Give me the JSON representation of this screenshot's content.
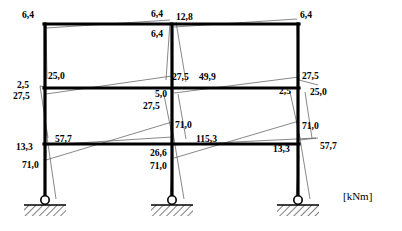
{
  "diagram": {
    "type": "bending-moment-diagram",
    "unit_label": "[kNm]",
    "structure": {
      "kind": "three-bay-three-storey-plane-frame",
      "columns": 3,
      "storeys": 3,
      "support_type": "pinned",
      "supports_count": 3
    },
    "labels": [
      {
        "id": "top-left-corner",
        "text": "6,4",
        "x": 22,
        "y": 10
      },
      {
        "id": "top-mid-above-left",
        "text": "6,4",
        "x": 151,
        "y": 9
      },
      {
        "id": "top-mid-right",
        "text": "12,8",
        "x": 176,
        "y": 12
      },
      {
        "id": "top-mid-below",
        "text": "6,4",
        "x": 151,
        "y": 29
      },
      {
        "id": "top-right-corner",
        "text": "6,4",
        "x": 300,
        "y": 10
      },
      {
        "id": "lvl2-left-outer-upper",
        "text": "2,5",
        "x": 17,
        "y": 80
      },
      {
        "id": "lvl2-left-outer-lower",
        "text": "27,5",
        "x": 13,
        "y": 91
      },
      {
        "id": "lvl2-left-inner",
        "text": "25,0",
        "x": 48,
        "y": 71
      },
      {
        "id": "lvl2-mid-upper-left",
        "text": "27,5",
        "x": 172,
        "y": 72
      },
      {
        "id": "lvl2-mid-upper-right",
        "text": "49,9",
        "x": 199,
        "y": 72
      },
      {
        "id": "lvl2-mid-below-upper",
        "text": "5,0",
        "x": 155,
        "y": 89
      },
      {
        "id": "lvl2-mid-below-lower",
        "text": "27,5",
        "x": 143,
        "y": 101
      },
      {
        "id": "lvl2-right-outer",
        "text": "27,5",
        "x": 302,
        "y": 71
      },
      {
        "id": "lvl2-right-inner-left",
        "text": "2,5",
        "x": 279,
        "y": 86
      },
      {
        "id": "lvl2-right-inner-right",
        "text": "25,0",
        "x": 310,
        "y": 87
      },
      {
        "id": "lvl3-mid-col-upper",
        "text": "71,0",
        "x": 175,
        "y": 120
      },
      {
        "id": "lvl3-right-col-upper",
        "text": "71,0",
        "x": 302,
        "y": 121
      },
      {
        "id": "lvl3-left-outer",
        "text": "13,3",
        "x": 16,
        "y": 142
      },
      {
        "id": "lvl3-left-inner",
        "text": "57,7",
        "x": 55,
        "y": 134
      },
      {
        "id": "lvl3-mid-beam-right",
        "text": "115,3",
        "x": 196,
        "y": 134
      },
      {
        "id": "lvl3-right-outer",
        "text": "13,3",
        "x": 273,
        "y": 144
      },
      {
        "id": "lvl3-right-inner",
        "text": "57,7",
        "x": 320,
        "y": 141
      },
      {
        "id": "lvl3-left-below",
        "text": "71,0",
        "x": 22,
        "y": 160
      },
      {
        "id": "lvl3-mid-below-upper",
        "text": "26,6",
        "x": 150,
        "y": 148
      },
      {
        "id": "lvl3-mid-below-lower",
        "text": "71,0",
        "x": 150,
        "y": 161
      }
    ],
    "moment_values": [
      "6,4",
      "12,8",
      "25,0",
      "27,5",
      "2,5",
      "5,0",
      "49,9",
      "71,0",
      "57,7",
      "13,3",
      "115,3",
      "26,6"
    ],
    "colors": {
      "frame_line": "#000000",
      "moment_line": "#4a4a4a",
      "label_text": "#000000",
      "background": "#ffffff"
    }
  }
}
